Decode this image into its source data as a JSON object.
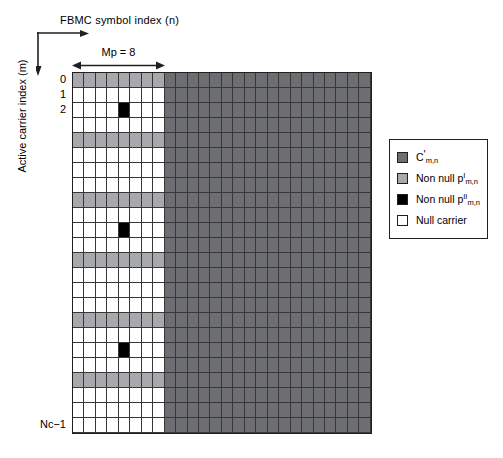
{
  "axes": {
    "x_label": "FBMC symbol index (n)",
    "y_label": "Active carrier index (m)",
    "mp_label": "Mp = 8"
  },
  "row_labels": {
    "r0": "0",
    "r1": "1",
    "r2": "2",
    "last": "Nc−1"
  },
  "legend": {
    "items": [
      {
        "name": "c-prime",
        "label_main": "C",
        "prime": "'",
        "sup": "",
        "sub": "m,n",
        "color": "#6d6e71"
      },
      {
        "name": "non-null-p1",
        "label_main": "Non null p",
        "prime": "",
        "sup": "I",
        "sub": "m,n",
        "color": "#a7a9ac"
      },
      {
        "name": "non-null-p2",
        "label_main": "Non null p",
        "prime": "",
        "sup": "II",
        "sub": "m,n",
        "color": "#000000"
      },
      {
        "name": "null-carrier",
        "label_main": "Null carrier",
        "prime": "",
        "sup": "",
        "sub": "",
        "color": "#ffffff"
      }
    ]
  },
  "colors": {
    "data_dark_gray": "#6d6e71",
    "pilot_light_gray": "#a7a9ac",
    "pilot_black": "#000000",
    "null_white": "#ffffff",
    "grid_line": "#231f20"
  },
  "chart_data": {
    "type": "heatmap",
    "title": "",
    "xlabel": "FBMC symbol index (n)",
    "ylabel": "Active carrier index (m)",
    "rows": 24,
    "cols": 26,
    "preamble_cols": 8,
    "annotation": "Mp = 8",
    "x_tick_labels": [],
    "y_tick_labels": [
      "0",
      "1",
      "2",
      "Nc−1"
    ],
    "y_tick_rows": [
      0,
      1,
      2,
      23
    ],
    "legend_position": "right",
    "grid": true,
    "category_codes": {
      "0": "null_white",
      "1": "pilot_light_gray",
      "2": "pilot_black",
      "3": "data_dark_gray"
    },
    "matrix": [
      [
        1,
        1,
        1,
        1,
        1,
        1,
        1,
        1,
        3,
        3,
        3,
        3,
        3,
        3,
        3,
        3,
        3,
        3,
        3,
        3,
        3,
        3,
        3,
        3,
        3,
        3
      ],
      [
        0,
        0,
        0,
        0,
        0,
        0,
        0,
        0,
        3,
        3,
        3,
        3,
        3,
        3,
        3,
        3,
        3,
        3,
        3,
        3,
        3,
        3,
        3,
        3,
        3,
        3
      ],
      [
        0,
        0,
        0,
        0,
        2,
        0,
        0,
        0,
        3,
        3,
        3,
        3,
        3,
        3,
        3,
        3,
        3,
        3,
        3,
        3,
        3,
        3,
        3,
        3,
        3,
        3
      ],
      [
        0,
        0,
        0,
        0,
        0,
        0,
        0,
        0,
        3,
        3,
        3,
        3,
        3,
        3,
        3,
        3,
        3,
        3,
        3,
        3,
        3,
        3,
        3,
        3,
        3,
        3
      ],
      [
        1,
        1,
        1,
        1,
        1,
        1,
        1,
        1,
        3,
        3,
        3,
        3,
        3,
        3,
        3,
        3,
        3,
        3,
        3,
        3,
        3,
        3,
        3,
        3,
        3,
        3
      ],
      [
        0,
        0,
        0,
        0,
        0,
        0,
        0,
        0,
        3,
        3,
        3,
        3,
        3,
        3,
        3,
        3,
        3,
        3,
        3,
        3,
        3,
        3,
        3,
        3,
        3,
        3
      ],
      [
        0,
        0,
        0,
        0,
        0,
        0,
        0,
        0,
        3,
        3,
        3,
        3,
        3,
        3,
        3,
        3,
        3,
        3,
        3,
        3,
        3,
        3,
        3,
        3,
        3,
        3
      ],
      [
        0,
        0,
        0,
        0,
        0,
        0,
        0,
        0,
        3,
        3,
        3,
        3,
        3,
        3,
        3,
        3,
        3,
        3,
        3,
        3,
        3,
        3,
        3,
        3,
        3,
        3
      ],
      [
        1,
        1,
        1,
        1,
        1,
        1,
        1,
        1,
        3,
        3,
        3,
        3,
        3,
        3,
        3,
        3,
        3,
        3,
        3,
        3,
        3,
        3,
        3,
        3,
        3,
        3
      ],
      [
        0,
        0,
        0,
        0,
        0,
        0,
        0,
        0,
        3,
        3,
        3,
        3,
        3,
        3,
        3,
        3,
        3,
        3,
        3,
        3,
        3,
        3,
        3,
        3,
        3,
        3
      ],
      [
        0,
        0,
        0,
        0,
        2,
        0,
        0,
        0,
        3,
        3,
        3,
        3,
        3,
        3,
        3,
        3,
        3,
        3,
        3,
        3,
        3,
        3,
        3,
        3,
        3,
        3
      ],
      [
        0,
        0,
        0,
        0,
        0,
        0,
        0,
        0,
        3,
        3,
        3,
        3,
        3,
        3,
        3,
        3,
        3,
        3,
        3,
        3,
        3,
        3,
        3,
        3,
        3,
        3
      ],
      [
        1,
        1,
        1,
        1,
        1,
        1,
        1,
        1,
        3,
        3,
        3,
        3,
        3,
        3,
        3,
        3,
        3,
        3,
        3,
        3,
        3,
        3,
        3,
        3,
        3,
        3
      ],
      [
        0,
        0,
        0,
        0,
        0,
        0,
        0,
        0,
        3,
        3,
        3,
        3,
        3,
        3,
        3,
        3,
        3,
        3,
        3,
        3,
        3,
        3,
        3,
        3,
        3,
        3
      ],
      [
        0,
        0,
        0,
        0,
        0,
        0,
        0,
        0,
        3,
        3,
        3,
        3,
        3,
        3,
        3,
        3,
        3,
        3,
        3,
        3,
        3,
        3,
        3,
        3,
        3,
        3
      ],
      [
        0,
        0,
        0,
        0,
        0,
        0,
        0,
        0,
        3,
        3,
        3,
        3,
        3,
        3,
        3,
        3,
        3,
        3,
        3,
        3,
        3,
        3,
        3,
        3,
        3,
        3
      ],
      [
        1,
        1,
        1,
        1,
        1,
        1,
        1,
        1,
        3,
        3,
        3,
        3,
        3,
        3,
        3,
        3,
        3,
        3,
        3,
        3,
        3,
        3,
        3,
        3,
        3,
        3
      ],
      [
        0,
        0,
        0,
        0,
        0,
        0,
        0,
        0,
        3,
        3,
        3,
        3,
        3,
        3,
        3,
        3,
        3,
        3,
        3,
        3,
        3,
        3,
        3,
        3,
        3,
        3
      ],
      [
        0,
        0,
        0,
        0,
        2,
        0,
        0,
        0,
        3,
        3,
        3,
        3,
        3,
        3,
        3,
        3,
        3,
        3,
        3,
        3,
        3,
        3,
        3,
        3,
        3,
        3
      ],
      [
        0,
        0,
        0,
        0,
        0,
        0,
        0,
        0,
        3,
        3,
        3,
        3,
        3,
        3,
        3,
        3,
        3,
        3,
        3,
        3,
        3,
        3,
        3,
        3,
        3,
        3
      ],
      [
        1,
        1,
        1,
        1,
        1,
        1,
        1,
        1,
        3,
        3,
        3,
        3,
        3,
        3,
        3,
        3,
        3,
        3,
        3,
        3,
        3,
        3,
        3,
        3,
        3,
        3
      ],
      [
        0,
        0,
        0,
        0,
        0,
        0,
        0,
        0,
        3,
        3,
        3,
        3,
        3,
        3,
        3,
        3,
        3,
        3,
        3,
        3,
        3,
        3,
        3,
        3,
        3,
        3
      ],
      [
        0,
        0,
        0,
        0,
        0,
        0,
        0,
        0,
        3,
        3,
        3,
        3,
        3,
        3,
        3,
        3,
        3,
        3,
        3,
        3,
        3,
        3,
        3,
        3,
        3,
        3
      ],
      [
        0,
        0,
        0,
        0,
        0,
        0,
        0,
        0,
        3,
        3,
        3,
        3,
        3,
        3,
        3,
        3,
        3,
        3,
        3,
        3,
        3,
        3,
        3,
        3,
        3,
        3
      ]
    ]
  }
}
